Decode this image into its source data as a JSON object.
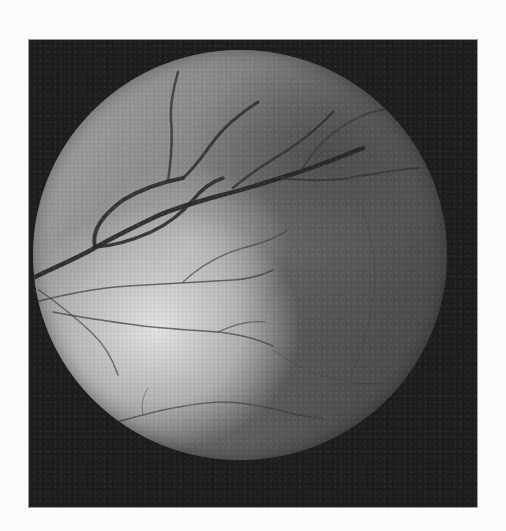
{
  "image": {
    "description": "Grayscale retinal fundus photograph",
    "colors": {
      "page_background": "#fbfbfb",
      "frame_background": "#1c1c1c",
      "disc_bright_region": "#e6e6e6",
      "disc_dark_region": "#4f4f4f",
      "vessel_color": "#2a2a2a"
    }
  }
}
